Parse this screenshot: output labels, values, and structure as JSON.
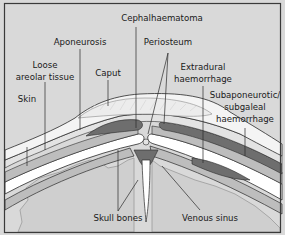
{
  "diagram": {
    "labels": {
      "cephalhaematoma": "Cephalhaematoma",
      "aponeurosis": "Aponeurosis",
      "periosteum": "Periosteum",
      "loose_areolar_1": "Loose",
      "loose_areolar_2": "areolar tissue",
      "caput": "Caput",
      "extradural_1": "Extradural",
      "extradural_2": "haemorrhage",
      "skin": "Skin",
      "subaponeurotic_1": "Subaponeurotic/",
      "subaponeurotic_2": "subgaleal",
      "subaponeurotic_3": "haemorrhage",
      "skull_bones": "Skull bones",
      "venous_sinus": "Venous sinus"
    },
    "colors": {
      "background": "#d9d9d9",
      "frame": "#3a3a3a",
      "skin": "#f4f4f4",
      "caput": "#ececec",
      "haemorrhage": "#6e6e6e",
      "bone": "#ffffff",
      "tissue": "#bdbdbd",
      "brain": "#cfcfcf",
      "line": "#2a2a2a"
    }
  }
}
